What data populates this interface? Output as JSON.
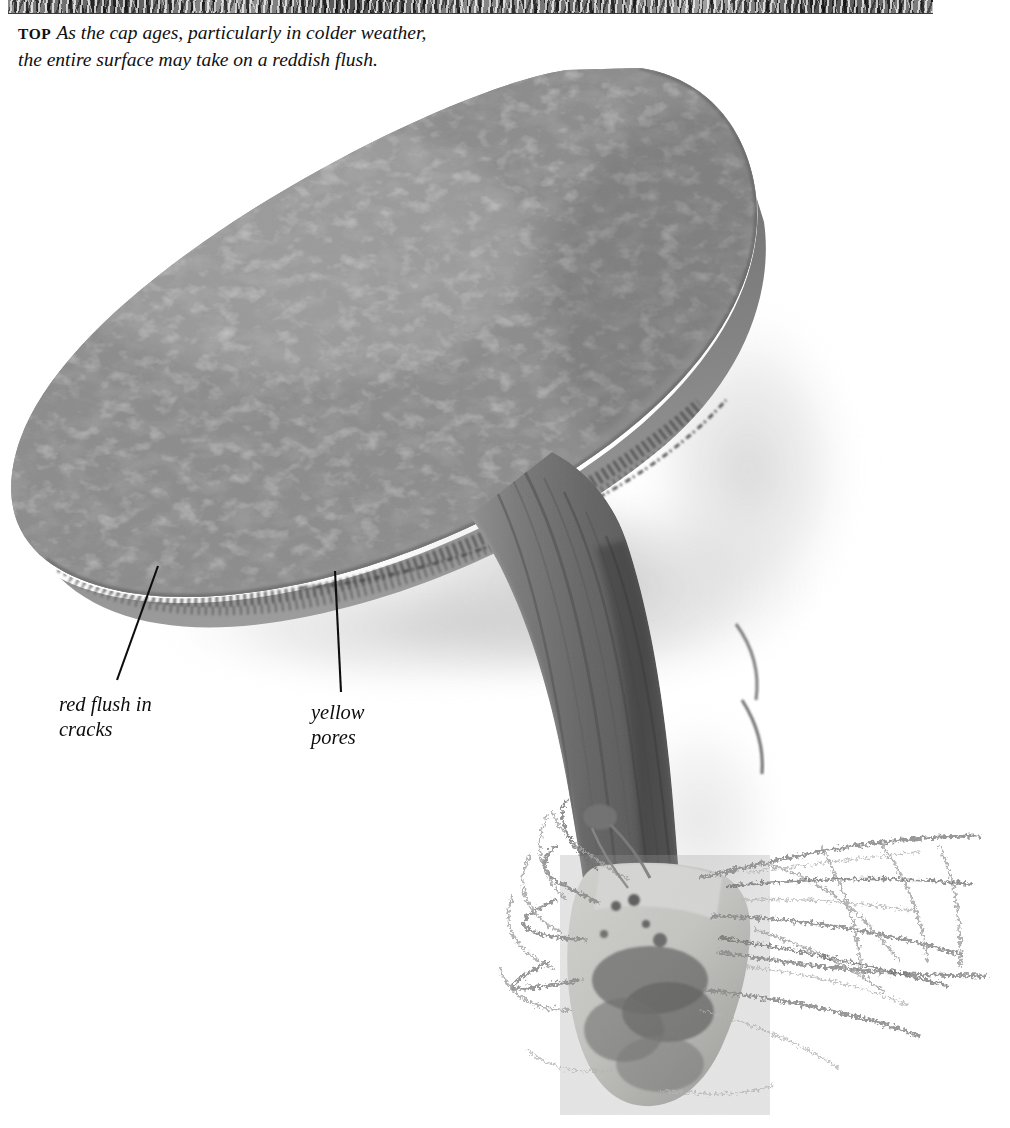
{
  "page": {
    "width": 1010,
    "height": 1128,
    "background": "#ffffff",
    "ink": "#101010"
  },
  "top_strip": {
    "name": "cropped-photo-strip-above",
    "description": "thin sliver of the bottom edge of the photograph printed above"
  },
  "caption": {
    "lead_in": "TOP",
    "text": "As the cap ages, particularly in colder weather, the entire surface may take on a reddish flush."
  },
  "photograph": {
    "subject": "bolete mushroom, whole fruiting body on white background",
    "parts": {
      "cap": "large tilted convex cap with cracked, tessellated surface",
      "pore_surface": "band of pores visible under the cap margin",
      "stem": "thick curved stem with vertical fibrous striations",
      "base": "pale swollen base with dark debris and spreading mycelial threads"
    },
    "tones": {
      "cap_base": "#8a8a8a",
      "cap_cracks_light": "#b2b2b2",
      "cap_patches_dark": "#4f4f4f",
      "pore_band": "#6f6f6f",
      "stem": "#787878",
      "stem_dark": "#4a4a4a",
      "base_pale": "#d8d8d4",
      "mycelium": "#9a9a9a",
      "shadow": "#cfcfcf"
    }
  },
  "annotations": [
    {
      "id": "red-flush",
      "label": "red flush in\ncracks",
      "leader": {
        "x1": 158,
        "y1": 566,
        "x2": 117,
        "y2": 680
      }
    },
    {
      "id": "yellow-pores",
      "label": "yellow\npores",
      "leader": {
        "x1": 335,
        "y1": 571,
        "x2": 341,
        "y2": 692
      }
    }
  ]
}
